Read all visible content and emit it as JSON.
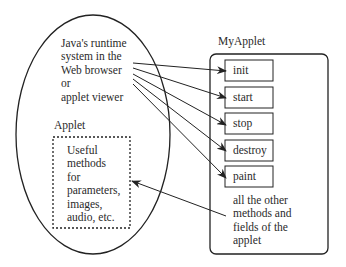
{
  "runtime": {
    "lines": [
      "Java's runtime",
      "system in the",
      "Web browser",
      "or",
      "applet viewer"
    ]
  },
  "applet": {
    "label": "Applet",
    "useful_lines": [
      "Useful",
      "methods",
      "for",
      "parameters,",
      "images,",
      "audio, etc."
    ]
  },
  "myapplet": {
    "title": "MyApplet",
    "methods": [
      "init",
      "start",
      "stop",
      "destroy",
      "paint"
    ],
    "other_lines": [
      "all the other",
      "methods and",
      "fields of the",
      "applet"
    ]
  },
  "colors": {
    "stroke": "#222222",
    "text": "#2a2a2a",
    "background": "#ffffff"
  }
}
